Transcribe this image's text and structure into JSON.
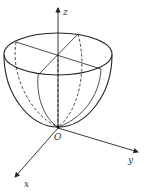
{
  "figure": {
    "colors": {
      "stroke": "#222222",
      "background": "#ffffff"
    },
    "axes": {
      "z_label": "z",
      "y_label": "y",
      "x_label": "x",
      "origin_label": "O"
    }
  }
}
